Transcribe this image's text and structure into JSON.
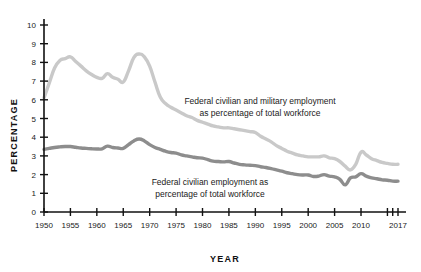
{
  "chart_data": {
    "type": "line",
    "title": "",
    "xlabel": "YEAR",
    "ylabel": "PERCENTAGE",
    "xlim": [
      1950,
      2017
    ],
    "ylim": [
      0,
      10
    ],
    "grid": false,
    "legend_position": "inline-annotation",
    "y_ticks": [
      "0",
      "1",
      "2",
      "3",
      "4",
      "5",
      "6",
      "7",
      "8",
      "9",
      "10"
    ],
    "x_ticks": [
      "1950",
      "1955",
      "1960",
      "1965",
      "1970",
      "1975",
      "1980",
      "1985",
      "1990",
      "1995",
      "2000",
      "2005",
      "2010",
      "2017"
    ],
    "x_tick_values": [
      1950,
      1955,
      1960,
      1965,
      1970,
      1975,
      1980,
      1985,
      1990,
      1995,
      2000,
      2005,
      2010,
      2017
    ],
    "x_extra_ticks": [
      2015,
      2016
    ],
    "colors": {
      "total_line": "#c9c9c9",
      "civilian_line": "#8d8d8d",
      "axis": "#111111",
      "text": "#1a1a1a",
      "background": "#ffffff"
    },
    "annotations": [
      {
        "name": "total-employment-label",
        "line1": "Federal civilian and military employment",
        "line2": "as percentage of total workforce",
        "x": 260,
        "y": 104
      },
      {
        "name": "civilian-employment-label",
        "line1": "Federal civilian employment as",
        "line2": "percentage of total workforce",
        "x": 210,
        "y": 185
      }
    ],
    "series": [
      {
        "name": "Federal civilian and military employment as percentage of total workforce",
        "color": "#c9c9c9",
        "x": [
          1950,
          1951,
          1952,
          1953,
          1954,
          1955,
          1956,
          1957,
          1958,
          1959,
          1960,
          1961,
          1962,
          1963,
          1964,
          1965,
          1966,
          1967,
          1968,
          1969,
          1970,
          1971,
          1972,
          1973,
          1974,
          1975,
          1976,
          1977,
          1978,
          1979,
          1980,
          1981,
          1982,
          1983,
          1984,
          1985,
          1986,
          1987,
          1988,
          1989,
          1990,
          1991,
          1992,
          1993,
          1994,
          1995,
          1996,
          1997,
          1998,
          1999,
          2000,
          2001,
          2002,
          2003,
          2004,
          2005,
          2006,
          2007,
          2008,
          2009,
          2010,
          2011,
          2012,
          2013,
          2014,
          2015,
          2016,
          2017
        ],
        "values": [
          6.1,
          6.9,
          7.7,
          8.1,
          8.2,
          8.3,
          8.05,
          7.8,
          7.55,
          7.35,
          7.2,
          7.15,
          7.4,
          7.2,
          7.1,
          6.95,
          7.55,
          8.25,
          8.45,
          8.3,
          7.8,
          6.95,
          6.15,
          5.8,
          5.6,
          5.45,
          5.3,
          5.15,
          5.05,
          4.9,
          4.8,
          4.7,
          4.6,
          4.55,
          4.5,
          4.5,
          4.45,
          4.4,
          4.35,
          4.3,
          4.25,
          4.05,
          3.9,
          3.75,
          3.55,
          3.4,
          3.25,
          3.15,
          3.05,
          3.0,
          2.95,
          2.95,
          2.95,
          3.0,
          2.9,
          2.85,
          2.7,
          2.45,
          2.25,
          2.55,
          3.2,
          3.05,
          2.85,
          2.75,
          2.65,
          2.6,
          2.55,
          2.55
        ]
      },
      {
        "name": "Federal civilian employment as percentage of total workforce",
        "color": "#8d8d8d",
        "x": [
          1950,
          1951,
          1952,
          1953,
          1954,
          1955,
          1956,
          1957,
          1958,
          1959,
          1960,
          1961,
          1962,
          1963,
          1964,
          1965,
          1966,
          1967,
          1968,
          1969,
          1970,
          1971,
          1972,
          1973,
          1974,
          1975,
          1976,
          1977,
          1978,
          1979,
          1980,
          1981,
          1982,
          1983,
          1984,
          1985,
          1986,
          1987,
          1988,
          1989,
          1990,
          1991,
          1992,
          1993,
          1994,
          1995,
          1996,
          1997,
          1998,
          1999,
          2000,
          2001,
          2002,
          2003,
          2004,
          2005,
          2006,
          2007,
          2008,
          2009,
          2010,
          2011,
          2012,
          2013,
          2014,
          2015,
          2016,
          2017
        ],
        "values": [
          3.35,
          3.4,
          3.45,
          3.48,
          3.5,
          3.5,
          3.46,
          3.42,
          3.4,
          3.38,
          3.37,
          3.38,
          3.52,
          3.45,
          3.42,
          3.4,
          3.6,
          3.8,
          3.9,
          3.8,
          3.6,
          3.45,
          3.35,
          3.25,
          3.18,
          3.15,
          3.05,
          3.0,
          2.95,
          2.9,
          2.88,
          2.8,
          2.72,
          2.7,
          2.68,
          2.7,
          2.62,
          2.55,
          2.52,
          2.5,
          2.48,
          2.42,
          2.38,
          2.32,
          2.25,
          2.18,
          2.1,
          2.05,
          2.0,
          1.98,
          1.98,
          1.9,
          1.92,
          2.0,
          1.92,
          1.88,
          1.75,
          1.45,
          1.82,
          1.88,
          2.05,
          1.92,
          1.82,
          1.78,
          1.72,
          1.7,
          1.65,
          1.65
        ]
      }
    ]
  },
  "axis_titles": {
    "x": "YEAR",
    "y": "PERCENTAGE"
  }
}
